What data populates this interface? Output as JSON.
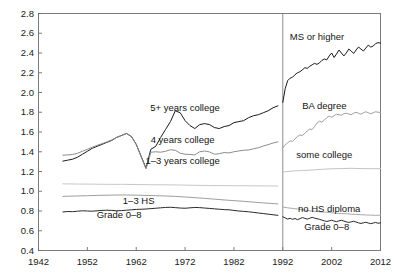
{
  "chart_data": {
    "type": "line",
    "title": "",
    "xlabel": "",
    "ylabel": "",
    "xlim": [
      1942,
      2012
    ],
    "ylim": [
      0.4,
      2.8
    ],
    "grid": false,
    "legend_position": "inline-annotations",
    "xticks": [
      "1942",
      "1952",
      "1962",
      "1972",
      "1982",
      "1992",
      "2002",
      "2012"
    ],
    "xtick_values": [
      1942,
      1952,
      1962,
      1972,
      1982,
      1992,
      2002,
      2012
    ],
    "yticks": [
      "0.4",
      "0.6",
      "0.8",
      "1.0",
      "1.2",
      "1.4",
      "1.6",
      "1.8",
      "2.0",
      "2.2",
      "2.4",
      "2.6",
      "2.8"
    ],
    "ytick_values": [
      0.4,
      0.6,
      0.8,
      1.0,
      1.2,
      1.4,
      1.6,
      1.8,
      2.0,
      2.2,
      2.4,
      2.6,
      2.8
    ],
    "annotations": [
      {
        "text": "5+ years college",
        "x": 1972.0,
        "y": 1.84
      },
      {
        "text": "4 years college",
        "x": 1971.5,
        "y": 1.52
      },
      {
        "text": "1–3 years college",
        "x": 1971.5,
        "y": 1.31
      },
      {
        "text": "1–3 HS",
        "x": 1962.5,
        "y": 0.905
      },
      {
        "text": "Grade 0–8",
        "x": 1958.5,
        "y": 0.755
      },
      {
        "text": "MS or higher",
        "x": 1999.0,
        "y": 2.56
      },
      {
        "text": "BA degree",
        "x": 2000.5,
        "y": 1.86
      },
      {
        "text": "some college",
        "x": 2000.5,
        "y": 1.37
      },
      {
        "text": "no HS diploma",
        "x": 2001.5,
        "y": 0.825
      },
      {
        "text": "Grade 0–8",
        "x": 2001.0,
        "y": 0.64
      }
    ],
    "vertical_divider": {
      "x": 1992,
      "color": "#808080"
    },
    "series": [
      {
        "name": "5+ years college",
        "period": "1947-1991",
        "color": "#1a1a1a",
        "width": 1.0,
        "x": [
          1947,
          1948,
          1949,
          1950,
          1951,
          1952,
          1953,
          1954,
          1955,
          1956,
          1957,
          1958,
          1959,
          1960,
          1961,
          1962,
          1963,
          1964,
          1965,
          1966,
          1967,
          1968,
          1969,
          1970,
          1971,
          1972,
          1973,
          1974,
          1975,
          1976,
          1977,
          1978,
          1979,
          1980,
          1981,
          1982,
          1983,
          1984,
          1985,
          1986,
          1987,
          1988,
          1989,
          1990,
          1991
        ],
        "values": [
          1.305,
          1.315,
          1.325,
          1.345,
          1.375,
          1.405,
          1.435,
          1.455,
          1.475,
          1.495,
          1.515,
          1.545,
          1.565,
          1.585,
          1.555,
          1.475,
          1.355,
          1.235,
          1.425,
          1.455,
          1.545,
          1.625,
          1.705,
          1.815,
          1.795,
          1.715,
          1.665,
          1.635,
          1.675,
          1.685,
          1.675,
          1.645,
          1.635,
          1.655,
          1.665,
          1.695,
          1.705,
          1.715,
          1.745,
          1.765,
          1.775,
          1.795,
          1.815,
          1.845,
          1.865
        ]
      },
      {
        "name": "4 years college",
        "period": "1947-1991",
        "color": "#8c8c8c",
        "width": 1.0,
        "x": [
          1947,
          1948,
          1949,
          1950,
          1951,
          1952,
          1953,
          1954,
          1955,
          1956,
          1957,
          1958,
          1959,
          1960,
          1961,
          1962,
          1963,
          1964,
          1965,
          1966,
          1967,
          1968,
          1969,
          1970,
          1971,
          1972,
          1973,
          1974,
          1975,
          1976,
          1977,
          1978,
          1979,
          1980,
          1981,
          1982,
          1983,
          1984,
          1985,
          1986,
          1987,
          1988,
          1989,
          1990,
          1991
        ],
        "values": [
          1.365,
          1.368,
          1.372,
          1.385,
          1.405,
          1.425,
          1.445,
          1.465,
          1.482,
          1.5,
          1.52,
          1.545,
          1.565,
          1.585,
          1.555,
          1.475,
          1.35,
          1.225,
          1.395,
          1.4,
          1.395,
          1.405,
          1.42,
          1.415,
          1.385,
          1.375,
          1.372,
          1.368,
          1.4,
          1.408,
          1.398,
          1.375,
          1.38,
          1.392,
          1.388,
          1.4,
          1.408,
          1.415,
          1.418,
          1.43,
          1.44,
          1.458,
          1.472,
          1.488,
          1.5
        ]
      },
      {
        "name": "1-3 years college",
        "period": "1947-1991",
        "color": "#c8c8c8",
        "width": 1.0,
        "x": [
          1947,
          1950,
          1953,
          1956,
          1959,
          1962,
          1965,
          1968,
          1971,
          1974,
          1977,
          1980,
          1983,
          1986,
          1989,
          1991
        ],
        "values": [
          1.075,
          1.073,
          1.072,
          1.07,
          1.07,
          1.068,
          1.066,
          1.065,
          1.063,
          1.06,
          1.058,
          1.057,
          1.056,
          1.055,
          1.054,
          1.053
        ]
      },
      {
        "name": "1-3 HS",
        "period": "1947-1991",
        "color": "#9e9e9e",
        "width": 1.0,
        "x": [
          1947,
          1948,
          1950,
          1952,
          1954,
          1956,
          1958,
          1960,
          1962,
          1964,
          1966,
          1968,
          1970,
          1972,
          1974,
          1976,
          1978,
          1980,
          1982,
          1984,
          1986,
          1988,
          1990,
          1991
        ],
        "values": [
          0.948,
          0.95,
          0.952,
          0.955,
          0.958,
          0.96,
          0.962,
          0.962,
          0.96,
          0.958,
          0.955,
          0.952,
          0.948,
          0.942,
          0.935,
          0.928,
          0.92,
          0.912,
          0.905,
          0.898,
          0.89,
          0.882,
          0.875,
          0.872
        ]
      },
      {
        "name": "Grade 0-8",
        "period": "1947-1991",
        "color": "#2a2a2a",
        "width": 1.0,
        "x": [
          1947,
          1948,
          1949,
          1950,
          1951,
          1952,
          1953,
          1954,
          1955,
          1956,
          1957,
          1958,
          1959,
          1960,
          1961,
          1962,
          1963,
          1964,
          1965,
          1966,
          1967,
          1968,
          1969,
          1970,
          1971,
          1972,
          1973,
          1974,
          1975,
          1976,
          1977,
          1978,
          1979,
          1980,
          1981,
          1982,
          1983,
          1984,
          1985,
          1986,
          1987,
          1988,
          1989,
          1990,
          1991
        ],
        "values": [
          0.79,
          0.795,
          0.793,
          0.798,
          0.802,
          0.8,
          0.798,
          0.802,
          0.806,
          0.808,
          0.806,
          0.802,
          0.804,
          0.808,
          0.812,
          0.816,
          0.818,
          0.82,
          0.824,
          0.828,
          0.832,
          0.836,
          0.838,
          0.834,
          0.83,
          0.828,
          0.832,
          0.836,
          0.834,
          0.83,
          0.826,
          0.822,
          0.818,
          0.814,
          0.812,
          0.806,
          0.8,
          0.796,
          0.792,
          0.786,
          0.78,
          0.774,
          0.768,
          0.762,
          0.756
        ]
      },
      {
        "name": "MS or higher",
        "period": "1992-2012",
        "color": "#1a1a1a",
        "width": 1.0,
        "x": [
          1992,
          1992.5,
          1993,
          1993.5,
          1994,
          1994.5,
          1995,
          1995.5,
          1996,
          1996.5,
          1997,
          1997.5,
          1998,
          1998.5,
          1999,
          1999.5,
          2000,
          2000.5,
          2001,
          2001.5,
          2002,
          2002.5,
          2003,
          2003.5,
          2004,
          2004.5,
          2005,
          2005.5,
          2006,
          2006.5,
          2007,
          2007.5,
          2008,
          2008.5,
          2009,
          2009.5,
          2010,
          2010.5,
          2011,
          2011.5,
          2012
        ],
        "values": [
          1.9,
          2.04,
          2.12,
          2.145,
          2.155,
          2.18,
          2.2,
          2.21,
          2.23,
          2.25,
          2.245,
          2.265,
          2.28,
          2.295,
          2.285,
          2.3,
          2.325,
          2.34,
          2.33,
          2.37,
          2.4,
          2.355,
          2.39,
          2.43,
          2.4,
          2.37,
          2.4,
          2.44,
          2.42,
          2.395,
          2.43,
          2.46,
          2.44,
          2.42,
          2.45,
          2.48,
          2.46,
          2.47,
          2.495,
          2.505,
          2.5
        ]
      },
      {
        "name": "BA degree",
        "period": "1992-2012",
        "color": "#9e9e9e",
        "width": 1.0,
        "x": [
          1992,
          1992.5,
          1993,
          1993.5,
          1994,
          1994.5,
          1995,
          1995.5,
          1996,
          1996.5,
          1997,
          1997.5,
          1998,
          1998.5,
          1999,
          1999.5,
          2000,
          2000.5,
          2001,
          2001.5,
          2002,
          2002.5,
          2003,
          2003.5,
          2004,
          2004.5,
          2005,
          2005.5,
          2006,
          2006.5,
          2007,
          2007.5,
          2008,
          2008.5,
          2009,
          2009.5,
          2010,
          2010.5,
          2011,
          2011.5,
          2012
        ],
        "values": [
          1.44,
          1.47,
          1.49,
          1.51,
          1.505,
          1.53,
          1.555,
          1.57,
          1.565,
          1.585,
          1.61,
          1.63,
          1.625,
          1.655,
          1.69,
          1.71,
          1.7,
          1.72,
          1.745,
          1.76,
          1.75,
          1.765,
          1.78,
          1.775,
          1.77,
          1.785,
          1.79,
          1.782,
          1.775,
          1.79,
          1.8,
          1.79,
          1.78,
          1.795,
          1.805,
          1.795,
          1.785,
          1.795,
          1.805,
          1.8,
          1.8
        ]
      },
      {
        "name": "some college",
        "period": "1992-2012",
        "color": "#c4c4c4",
        "width": 1.0,
        "x": [
          1992,
          1994,
          1996,
          1998,
          2000,
          2002,
          2004,
          2006,
          2008,
          2010,
          2012
        ],
        "values": [
          1.195,
          1.205,
          1.21,
          1.215,
          1.222,
          1.228,
          1.23,
          1.232,
          1.23,
          1.228,
          1.23
        ]
      },
      {
        "name": "no HS diploma",
        "period": "1992-2012",
        "color": "#a8a8a8",
        "width": 1.0,
        "x": [
          1992,
          1993,
          1994,
          1995,
          1996,
          1997,
          1998,
          1999,
          2000,
          2001,
          2002,
          2003,
          2004,
          2005,
          2006,
          2007,
          2008,
          2009,
          2010,
          2011,
          2012
        ],
        "values": [
          0.84,
          0.832,
          0.826,
          0.82,
          0.814,
          0.806,
          0.798,
          0.796,
          0.79,
          0.788,
          0.782,
          0.778,
          0.774,
          0.772,
          0.768,
          0.766,
          0.762,
          0.76,
          0.758,
          0.756,
          0.758
        ]
      },
      {
        "name": "Grade 0-8",
        "period": "1992-2012",
        "color": "#2a2a2a",
        "width": 1.0,
        "x": [
          1992,
          1992.5,
          1993,
          1993.5,
          1994,
          1994.5,
          1995,
          1995.5,
          1996,
          1996.5,
          1997,
          1997.5,
          1998,
          1998.5,
          1999,
          1999.5,
          2000,
          2000.5,
          2001,
          2001.5,
          2002,
          2002.5,
          2003,
          2003.5,
          2004,
          2004.5,
          2005,
          2005.5,
          2006,
          2006.5,
          2007,
          2007.5,
          2008,
          2008.5,
          2009,
          2009.5,
          2010,
          2010.5,
          2011,
          2011.5,
          2012
        ],
        "values": [
          0.742,
          0.73,
          0.718,
          0.726,
          0.716,
          0.724,
          0.712,
          0.722,
          0.734,
          0.726,
          0.718,
          0.726,
          0.736,
          0.728,
          0.722,
          0.716,
          0.708,
          0.7,
          0.694,
          0.7,
          0.706,
          0.698,
          0.692,
          0.7,
          0.706,
          0.698,
          0.69,
          0.684,
          0.69,
          0.696,
          0.688,
          0.68,
          0.674,
          0.68,
          0.686,
          0.678,
          0.672,
          0.678,
          0.684,
          0.676,
          0.68
        ]
      }
    ]
  }
}
